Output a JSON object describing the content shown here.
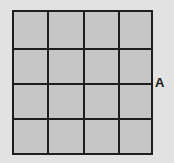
{
  "diagram": {
    "type": "square grid",
    "rows": 4,
    "columns": 4,
    "cell_color": "#c6c6c6",
    "line_color": "#1e1e1e",
    "background_color": "#e2e2e2",
    "label": {
      "text": "A",
      "position": "right side, at the line between row 2 and row 3"
    }
  }
}
